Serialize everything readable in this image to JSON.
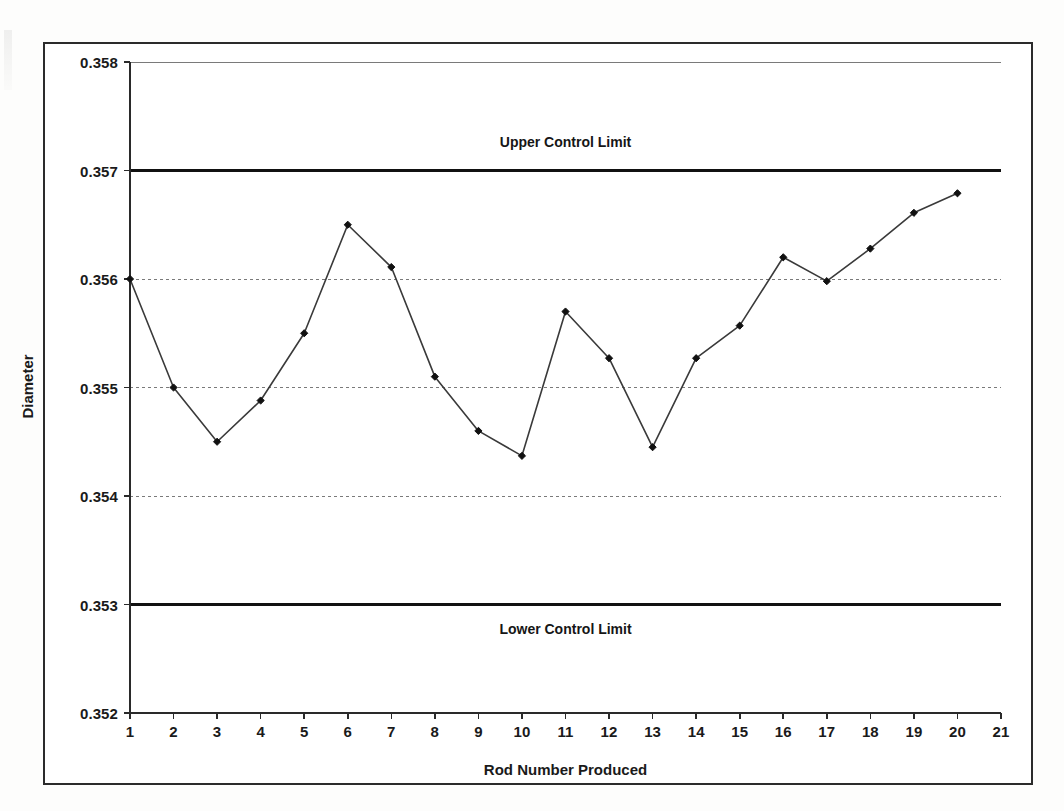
{
  "chart_data": {
    "type": "line",
    "title": "",
    "xlabel": "Rod Number Produced",
    "ylabel": "Diameter",
    "x": [
      1,
      2,
      3,
      4,
      5,
      6,
      7,
      8,
      9,
      10,
      11,
      12,
      13,
      14,
      15,
      16,
      17,
      18,
      19,
      20
    ],
    "values": [
      0.356,
      0.355,
      0.3545,
      0.35488,
      0.3555,
      0.3565,
      0.35611,
      0.3551,
      0.3546,
      0.35437,
      0.3557,
      0.35527,
      0.35445,
      0.35527,
      0.35557,
      0.3562,
      0.35598,
      0.35628,
      0.35661,
      0.35679
    ],
    "xlim": [
      1,
      21
    ],
    "ylim": [
      0.352,
      0.358
    ],
    "xticks": [
      "1",
      "2",
      "3",
      "4",
      "5",
      "6",
      "7",
      "8",
      "9",
      "10",
      "11",
      "12",
      "13",
      "14",
      "15",
      "16",
      "17",
      "18",
      "19",
      "20",
      "21"
    ],
    "yticks": [
      "0.352",
      "0.353",
      "0.354",
      "0.355",
      "0.356",
      "0.357",
      "0.358"
    ],
    "ytick_values": [
      0.352,
      0.353,
      0.354,
      0.355,
      0.356,
      0.357,
      0.358
    ],
    "grid": true,
    "legend": "none",
    "marker": "diamond",
    "series_color": "#3a3a3a",
    "annotations": [
      {
        "name": "upper-control-limit",
        "label": "Upper Control Limit",
        "value": 0.357,
        "label_position": "above"
      },
      {
        "name": "lower-control-limit",
        "label": "Lower Control Limit",
        "value": 0.353,
        "label_position": "below"
      }
    ]
  },
  "colors": {
    "frame": "#2b2b2b",
    "axis": "#2a2a2a",
    "gridline": "#7a7a7a",
    "limit_line": "#111111",
    "data_line": "#3a3a3a",
    "marker": "#111111",
    "text": "#1a1a1a",
    "page_background": "#fdfdfc",
    "plot_background": "#ffffff"
  }
}
